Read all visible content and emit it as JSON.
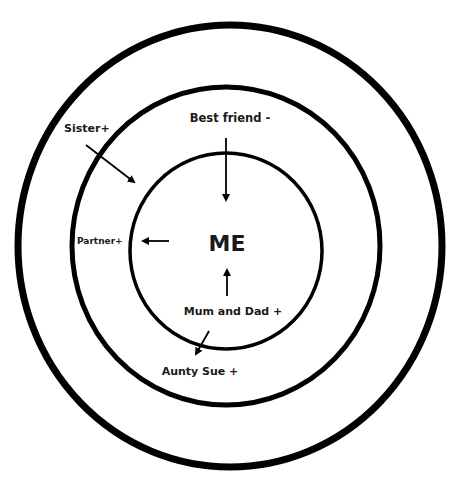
{
  "diagram": {
    "type": "concentric-relationship-circles",
    "center_label": "ME",
    "rings": [
      {
        "name": "inner-circle",
        "level": 1
      },
      {
        "name": "middle-circle",
        "level": 2
      },
      {
        "name": "outer-circle",
        "level": 3
      }
    ],
    "people": [
      {
        "label": "Best friend -",
        "movement": "inward",
        "from_ring": 2,
        "to_ring": 1
      },
      {
        "label": "Sister+",
        "movement": "inward",
        "from_ring": 3,
        "to_ring": 2
      },
      {
        "label": "Partner+",
        "movement": "outward",
        "from_ring": 1,
        "to_ring": 2
      },
      {
        "label": "Mum and Dad +",
        "movement": "inward",
        "from_ring": 1,
        "to_ring": 1
      },
      {
        "label": "Aunty Sue +",
        "movement": "outward",
        "from_ring": 1,
        "to_ring": 2
      }
    ],
    "colors": {
      "line": "#000000",
      "text": "#1a1a1a",
      "background": "#ffffff"
    }
  }
}
